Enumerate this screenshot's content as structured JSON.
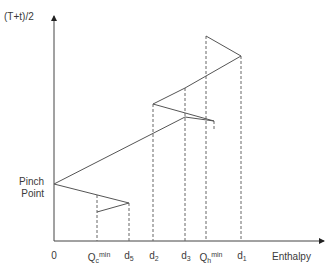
{
  "diagram": {
    "type": "composite-curve-enthalpy-diagram",
    "y_axis_label": "(T+t)/2",
    "x_axis_label": "Enthalpy",
    "pinch_label_line1": "Pinch",
    "pinch_label_line2": "Point",
    "ticks": [
      {
        "id": "zero",
        "base": "0",
        "sub": "",
        "sup": "",
        "x": 54
      },
      {
        "id": "qc-min",
        "base": "Q",
        "sub": "c",
        "sup": "min",
        "x": 97
      },
      {
        "id": "d5",
        "base": "d",
        "sub": "5",
        "sup": "",
        "x": 129
      },
      {
        "id": "d2",
        "base": "d",
        "sub": "2",
        "sup": "",
        "x": 153
      },
      {
        "id": "d3",
        "base": "d",
        "sub": "3",
        "sup": "",
        "x": 185
      },
      {
        "id": "qh-min",
        "base": "Q",
        "sub": "h",
        "sup": "min",
        "x": 206
      },
      {
        "id": "d1",
        "base": "d",
        "sub": "1",
        "sup": "",
        "x": 241
      }
    ],
    "line_color": "#555555",
    "dash_color": "#666666"
  }
}
